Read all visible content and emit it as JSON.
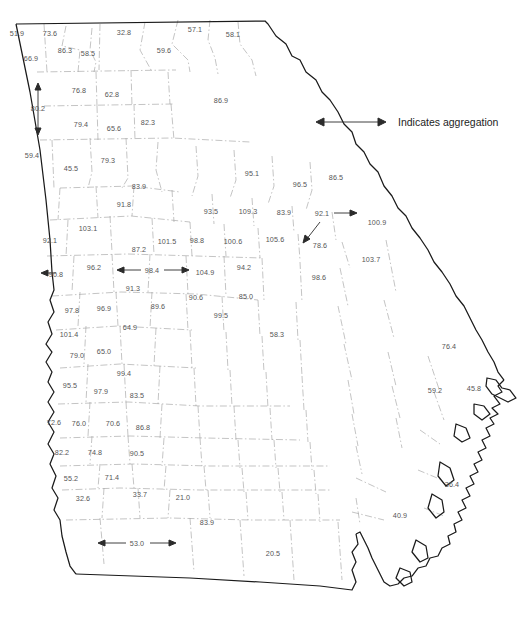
{
  "figure": {
    "type": "choropleth-value-map",
    "region": "Georgia",
    "caption": "",
    "legend": {
      "label": "Indicates aggregation",
      "arrow_icon": "double-headed-arrow-icon",
      "x": 395,
      "y": 122
    },
    "style": {
      "state_border_color": "#1a1a1a",
      "county_border_color": "#9a9a9a",
      "label_color": "#555555",
      "background": "#ffffff"
    }
  },
  "chart_data": {
    "type": "map",
    "title": "",
    "xlabel": "",
    "ylabel": "",
    "value_label_count": 79,
    "aggregation_markers": [
      {
        "value": "80.2",
        "orientation": "vertical",
        "x": 38,
        "y": 108
      },
      {
        "value": "98.4",
        "orientation": "horizontal",
        "x": 152,
        "y": 270
      },
      {
        "value": "92.1",
        "orientation": "right",
        "x": 322,
        "y": 213
      },
      {
        "value": "53.0",
        "orientation": "horizontal",
        "x": 137,
        "y": 543
      }
    ],
    "labels": [
      {
        "v": "51.9",
        "x": 17,
        "y": 33
      },
      {
        "v": "73.6",
        "x": 50,
        "y": 33
      },
      {
        "v": "32.8",
        "x": 124,
        "y": 32
      },
      {
        "v": "57.1",
        "x": 195,
        "y": 29
      },
      {
        "v": "58.1",
        "x": 233,
        "y": 34
      },
      {
        "v": "86.3",
        "x": 65,
        "y": 50
      },
      {
        "v": "58.5",
        "x": 88,
        "y": 53
      },
      {
        "v": "59.6",
        "x": 164,
        "y": 50
      },
      {
        "v": "66.9",
        "x": 31,
        "y": 58
      },
      {
        "v": "76.8",
        "x": 79,
        "y": 90
      },
      {
        "v": "62.8",
        "x": 112,
        "y": 94
      },
      {
        "v": "86.9",
        "x": 221,
        "y": 100
      },
      {
        "v": "80.2",
        "x": 38,
        "y": 108
      },
      {
        "v": "79.4",
        "x": 81,
        "y": 124
      },
      {
        "v": "65.6",
        "x": 114,
        "y": 128
      },
      {
        "v": "82.3",
        "x": 148,
        "y": 122
      },
      {
        "v": "59.4",
        "x": 32,
        "y": 155
      },
      {
        "v": "45.5",
        "x": 71,
        "y": 168
      },
      {
        "v": "79.3",
        "x": 108,
        "y": 160
      },
      {
        "v": "95.1",
        "x": 252,
        "y": 173
      },
      {
        "v": "96.5",
        "x": 300,
        "y": 184
      },
      {
        "v": "86.5",
        "x": 336,
        "y": 177
      },
      {
        "v": "83.9",
        "x": 139,
        "y": 186
      },
      {
        "v": "91.8",
        "x": 124,
        "y": 204
      },
      {
        "v": "93.5",
        "x": 211,
        "y": 211
      },
      {
        "v": "109.3",
        "x": 248,
        "y": 211
      },
      {
        "v": "83.9",
        "x": 284,
        "y": 212
      },
      {
        "v": "92.1",
        "x": 322,
        "y": 213
      },
      {
        "v": "100.9",
        "x": 377,
        "y": 222
      },
      {
        "v": "92.1",
        "x": 50,
        "y": 240
      },
      {
        "v": "103.1",
        "x": 88,
        "y": 228
      },
      {
        "v": "87.2",
        "x": 139,
        "y": 249
      },
      {
        "v": "101.5",
        "x": 167,
        "y": 241
      },
      {
        "v": "98.8",
        "x": 197,
        "y": 240
      },
      {
        "v": "100.6",
        "x": 233,
        "y": 241
      },
      {
        "v": "105.6",
        "x": 275,
        "y": 239
      },
      {
        "v": "78.6",
        "x": 320,
        "y": 245
      },
      {
        "v": "103.7",
        "x": 371,
        "y": 259
      },
      {
        "v": "90.8",
        "x": 56,
        "y": 274
      },
      {
        "v": "96.2",
        "x": 94,
        "y": 267
      },
      {
        "v": "98.4",
        "x": 152,
        "y": 270
      },
      {
        "v": "104.9",
        "x": 205,
        "y": 272
      },
      {
        "v": "94.2",
        "x": 244,
        "y": 267
      },
      {
        "v": "98.6",
        "x": 319,
        "y": 277
      },
      {
        "v": "91.3",
        "x": 133,
        "y": 288
      },
      {
        "v": "89.6",
        "x": 158,
        "y": 306
      },
      {
        "v": "90.6",
        "x": 196,
        "y": 297
      },
      {
        "v": "85.0",
        "x": 246,
        "y": 296
      },
      {
        "v": "97.8",
        "x": 72,
        "y": 310
      },
      {
        "v": "96.9",
        "x": 104,
        "y": 308
      },
      {
        "v": "99.5",
        "x": 221,
        "y": 315
      },
      {
        "v": "101.4",
        "x": 69,
        "y": 334
      },
      {
        "v": "64.9",
        "x": 130,
        "y": 327
      },
      {
        "v": "58.3",
        "x": 277,
        "y": 334
      },
      {
        "v": "79.0",
        "x": 77,
        "y": 355
      },
      {
        "v": "65.0",
        "x": 104,
        "y": 351
      },
      {
        "v": "76.4",
        "x": 449,
        "y": 346
      },
      {
        "v": "99.4",
        "x": 124,
        "y": 373
      },
      {
        "v": "95.5",
        "x": 70,
        "y": 385
      },
      {
        "v": "97.9",
        "x": 101,
        "y": 391
      },
      {
        "v": "83.5",
        "x": 137,
        "y": 395
      },
      {
        "v": "59.2",
        "x": 435,
        "y": 390
      },
      {
        "v": "45.8",
        "x": 474,
        "y": 388
      },
      {
        "v": "72.6",
        "x": 54,
        "y": 422
      },
      {
        "v": "76.0",
        "x": 79,
        "y": 423
      },
      {
        "v": "70.6",
        "x": 113,
        "y": 423
      },
      {
        "v": "86.8",
        "x": 143,
        "y": 427
      },
      {
        "v": "82.2",
        "x": 62,
        "y": 452
      },
      {
        "v": "74.8",
        "x": 95,
        "y": 452
      },
      {
        "v": "90.5",
        "x": 137,
        "y": 453
      },
      {
        "v": "55.2",
        "x": 71,
        "y": 478
      },
      {
        "v": "71.4",
        "x": 112,
        "y": 477
      },
      {
        "v": "36.4",
        "x": 452,
        "y": 484
      },
      {
        "v": "32.6",
        "x": 83,
        "y": 498
      },
      {
        "v": "33.7",
        "x": 140,
        "y": 494
      },
      {
        "v": "21.0",
        "x": 183,
        "y": 497
      },
      {
        "v": "40.9",
        "x": 400,
        "y": 515
      },
      {
        "v": "83.9",
        "x": 207,
        "y": 522
      },
      {
        "v": "53.0",
        "x": 137,
        "y": 543
      },
      {
        "v": "20.5",
        "x": 273,
        "y": 553
      }
    ]
  }
}
